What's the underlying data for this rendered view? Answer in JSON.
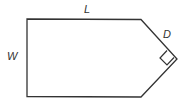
{
  "diagram": {
    "shape": "pentagon-like plot (rectangle with triangular right end)",
    "labels": {
      "length": "L",
      "width": "W",
      "diagonal": "D"
    },
    "right_angle_marker": true,
    "colors": {
      "stroke": "#333333",
      "background": "#ffffff"
    }
  }
}
